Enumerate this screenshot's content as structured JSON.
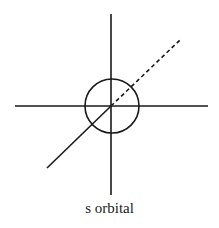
{
  "diagram": {
    "caption": "s orbital",
    "stroke_color": "#1a1a1a",
    "axes": {
      "vertical": {
        "x": 111,
        "y1": 14,
        "y2": 195
      },
      "horizontal": {
        "y": 106,
        "x1": 15,
        "x2": 208
      },
      "depth_solid": {
        "x1": 47,
        "y1": 168,
        "x2": 111,
        "y2": 106
      },
      "depth_dashed": {
        "x1": 111,
        "y1": 106,
        "x2": 180,
        "y2": 40
      }
    },
    "orbital_circle": {
      "cx": 112,
      "cy": 106,
      "r": 27
    }
  }
}
